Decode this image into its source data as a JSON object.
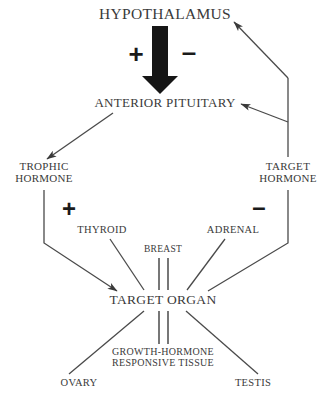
{
  "diagram": {
    "colors": {
      "background": "#ffffff",
      "line": "#4a4a4a",
      "text": "#3a3a3a",
      "arrow_fill": "#1a1a1a"
    },
    "nodes": [
      {
        "id": "hypothalamus",
        "label": "HYPOTHALAMUS",
        "x": 165,
        "y": 14
      },
      {
        "id": "anterior_pituitary",
        "label": "ANTERIOR PITUITARY",
        "x": 165,
        "y": 103
      },
      {
        "id": "trophic_hormone",
        "label": "TROPHIC\nHORMONE",
        "x": 44,
        "y": 173
      },
      {
        "id": "target_hormone",
        "label": "TARGET\nHORMONE",
        "x": 288,
        "y": 173
      },
      {
        "id": "thyroid",
        "label": "THYROID",
        "x": 102,
        "y": 230
      },
      {
        "id": "adrenal",
        "label": "ADRENAL",
        "x": 233,
        "y": 230
      },
      {
        "id": "breast",
        "label": "BREAST",
        "x": 163,
        "y": 249
      },
      {
        "id": "target_organ",
        "label": "TARGET ORGAN",
        "x": 163,
        "y": 300
      },
      {
        "id": "ghrt",
        "label": "GROWTH-HORMONE\nRESPONSIVE TISSUE",
        "x": 163,
        "y": 358
      },
      {
        "id": "ovary",
        "label": "OVARY",
        "x": 79,
        "y": 383
      },
      {
        "id": "testis",
        "label": "TESTIS",
        "x": 253,
        "y": 383
      }
    ],
    "signs": [
      {
        "id": "plus-hypothalamus",
        "symbol": "+",
        "x": 136,
        "y": 54,
        "size": "big"
      },
      {
        "id": "minus-hypothalamus",
        "symbol": "–",
        "x": 189,
        "y": 52,
        "size": "big"
      },
      {
        "id": "plus-trophic",
        "symbol": "+",
        "x": 69,
        "y": 209,
        "size": "mid"
      },
      {
        "id": "minus-target",
        "symbol": "–",
        "x": 259,
        "y": 207,
        "size": "mid"
      }
    ],
    "connections": [
      {
        "id": "hypothalamus-to-pituitary",
        "from": "hypothalamus",
        "to": "anterior_pituitary",
        "style": "thick-block-arrow",
        "arrowhead": true
      },
      {
        "id": "pituitary-to-trophic",
        "from": "anterior_pituitary",
        "to": "trophic_hormone",
        "style": "diagonal",
        "arrowhead": true
      },
      {
        "id": "trophic-to-target-organ",
        "from": "trophic_hormone",
        "to": "target_organ",
        "style": "elbow",
        "arrowhead": true
      },
      {
        "id": "target-organ-to-target-hormone",
        "from": "target_organ",
        "to": "target_hormone",
        "style": "elbow",
        "arrowhead": false
      },
      {
        "id": "target-hormone-to-pituitary",
        "from": "target_hormone",
        "to": "anterior_pituitary",
        "style": "elbow",
        "arrowhead": true
      },
      {
        "id": "target-hormone-to-hypothalamus",
        "from": "target_hormone",
        "to": "hypothalamus",
        "style": "elbow",
        "arrowhead": true
      },
      {
        "id": "thyroid-to-target-organ",
        "from": "thyroid",
        "to": "target_organ",
        "style": "diagonal",
        "arrowhead": false
      },
      {
        "id": "adrenal-to-target-organ",
        "from": "adrenal",
        "to": "target_organ",
        "style": "diagonal",
        "arrowhead": false
      },
      {
        "id": "breast-to-target-organ",
        "from": "breast",
        "to": "target_organ",
        "style": "double-vertical",
        "arrowhead": false
      },
      {
        "id": "target-organ-to-ghrt",
        "from": "target_organ",
        "to": "ghrt",
        "style": "double-vertical",
        "arrowhead": false
      },
      {
        "id": "target-organ-to-ovary",
        "from": "target_organ",
        "to": "ovary",
        "style": "diagonal",
        "arrowhead": false
      },
      {
        "id": "target-organ-to-testis",
        "from": "target_organ",
        "to": "testis",
        "style": "diagonal",
        "arrowhead": false
      }
    ]
  }
}
